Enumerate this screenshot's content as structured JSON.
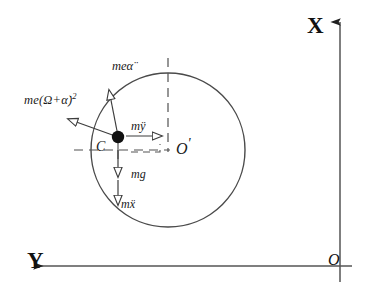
{
  "figure": {
    "type": "free-body-diagram",
    "background_color": "#ffffff",
    "line_color": "#3a3a3a",
    "text_color": "#1a1a1a"
  },
  "axes": {
    "x_label": "X",
    "y_label": "Y",
    "origin_label": "O",
    "x_direction": "up",
    "y_direction": "left",
    "origin_position": {
      "x": 340,
      "y": 266
    },
    "vertical_axis": {
      "x": 340,
      "y_top": 18,
      "y_bottom": 280
    },
    "horizontal_axis": {
      "y": 266,
      "x_left": 30,
      "x_right": 350
    }
  },
  "disc": {
    "name": "rotor-circle",
    "center": {
      "x": 168,
      "y": 150
    },
    "radius": 77,
    "stroke": "#4a4a4a",
    "stroke_width": 1.3
  },
  "points": [
    {
      "id": "mass-center",
      "label": "C",
      "description": "centre of mass",
      "x": 118,
      "y": 137,
      "marker": "filled-dot",
      "radius": 6
    },
    {
      "id": "geometric-center",
      "label": "O",
      "prime": "'",
      "description": "geometric centre of the disc",
      "x": 168,
      "y": 150,
      "marker": "none"
    }
  ],
  "guides": {
    "vertical_dashed": {
      "x": 168,
      "y_top": 62,
      "y_bottom": 150
    },
    "horizontal_dashed": {
      "y": 150,
      "x_left": 78,
      "x_right": 168
    },
    "small_cross": {
      "x": 118,
      "y": 150
    }
  },
  "force_vectors": [
    {
      "id": "centrifugal",
      "label": "me(Ω+α̇)",
      "label_exponent": "2",
      "label_plain": "me(Ω+α̇)²",
      "description": "centrifugal force along the line O-prime to C, directed outward",
      "from": {
        "x": 118,
        "y": 137
      },
      "to": {
        "x": 63,
        "y": 117
      },
      "arrow_style": "open-outline"
    },
    {
      "id": "tangential",
      "label": "meα̈",
      "description": "tangential inertia force, perpendicular to O-prime C",
      "from": {
        "x": 118,
        "y": 137
      },
      "to": {
        "x": 108,
        "y": 85
      },
      "arrow_style": "open-outline"
    },
    {
      "id": "m-y-ddot",
      "label": "mÿ",
      "description": "inertia force along Y direction, pointing toward O-prime",
      "from": {
        "x": 124,
        "y": 136
      },
      "to": {
        "x": 166,
        "y": 136
      },
      "arrow_style": "open-outline"
    },
    {
      "id": "m-g",
      "label": "mg",
      "description": "gravitational weight, directed downward",
      "from": {
        "x": 118,
        "y": 146
      },
      "to": {
        "x": 118,
        "y": 180
      },
      "arrow_style": "open-outline"
    },
    {
      "id": "m-x-ddot",
      "label": "mẍ",
      "description": "inertia force along X direction, directed downward",
      "from": {
        "x": 118,
        "y": 178
      },
      "to": {
        "x": 118,
        "y": 208
      },
      "arrow_style": "open-outline"
    }
  ]
}
